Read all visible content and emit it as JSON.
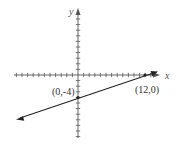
{
  "chart_data": {
    "type": "line",
    "title": "",
    "xlabel": "x",
    "ylabel": "y",
    "grid": false,
    "series": [
      {
        "name": "line",
        "equation": "y = x/3 - 4",
        "points": [
          {
            "x": 0,
            "y": -4,
            "label": "(0,-4)"
          },
          {
            "x": 12,
            "y": 0,
            "label": "(12,0)"
          }
        ],
        "slope": 0.3333,
        "intercept": -4
      }
    ],
    "xlim": [
      -11,
      14
    ],
    "ylim": [
      -11,
      11
    ],
    "tick_interval": 1,
    "annotations": [
      "(0,-4)",
      "(12,0)"
    ]
  },
  "labels": {
    "x_axis": "x",
    "y_axis": "y",
    "point_a": "(0,-4)",
    "point_b": "(12,0)"
  },
  "colors": {
    "axis": "#555555",
    "line": "#222222",
    "text": "#333333"
  }
}
